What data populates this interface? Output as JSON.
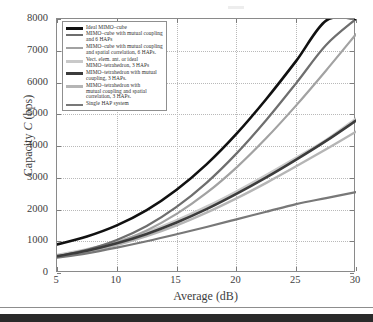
{
  "chart_data": {
    "type": "line",
    "title": "",
    "xlabel": "Average (dB)",
    "ylabel": "Capacity C (bps)",
    "xlim": [
      5,
      30
    ],
    "ylim": [
      0,
      8000
    ],
    "xticks": [
      5,
      10,
      15,
      20,
      25,
      30
    ],
    "yticks": [
      0,
      1000,
      2000,
      3000,
      4000,
      5000,
      6000,
      7000,
      8000
    ],
    "grid": true,
    "legend_position": "upper-left-inside",
    "x": [
      5,
      7.5,
      10,
      12.5,
      15,
      17.5,
      20,
      22.5,
      25,
      27.5,
      30
    ],
    "series": [
      {
        "name": "Ideal MIMO–cube",
        "color": "#111111",
        "width": 2.6,
        "values": [
          900,
          1150,
          1500,
          1980,
          2620,
          3420,
          4380,
          5480,
          6680,
          7950,
          8000
        ]
      },
      {
        "name": "MIMO–cube with mutual coupling and 6 HAPs",
        "color": "#6e6e6e",
        "width": 2.2,
        "values": [
          520,
          730,
          1040,
          1480,
          2080,
          2840,
          3760,
          4820,
          5980,
          7180,
          8000
        ]
      },
      {
        "name": "MIMO–cube with mutual coupling and spatial correlation, 6 HAPs.",
        "color": "#a2a2a2",
        "width": 2.2,
        "values": [
          520,
          690,
          960,
          1340,
          1860,
          2520,
          3320,
          4250,
          5280,
          6380,
          7520
        ]
      },
      {
        "name": "Vect. elem. ant. or ideal MIMO–tetrahedron, 3 HAPs",
        "color": "#c9c9c9",
        "width": 3.0,
        "values": [
          560,
          740,
          980,
          1280,
          1650,
          2080,
          2560,
          3080,
          3620,
          4180,
          4850
        ]
      },
      {
        "name": "MIMO–tetrahedron with mutual coupling, 3 HAPs.",
        "color": "#3c3c3c",
        "width": 2.6,
        "values": [
          530,
          700,
          935,
          1230,
          1590,
          2010,
          2490,
          3010,
          3570,
          4160,
          4800
        ]
      },
      {
        "name": "MIMO–tetrahedron with mutual coupling and spatial correlation, 3 HAPs.",
        "color": "#b5b5b5",
        "width": 2.4,
        "values": [
          500,
          660,
          880,
          1160,
          1500,
          1900,
          2350,
          2840,
          3360,
          3900,
          4450
        ]
      },
      {
        "name": "Single HAP system",
        "color": "#787878",
        "width": 2.2,
        "values": [
          480,
          620,
          800,
          1000,
          1220,
          1450,
          1690,
          1930,
          2170,
          2360,
          2550
        ]
      }
    ]
  },
  "axes": {
    "x_title": "Average (dB)",
    "y_title_prefix": "Capacity ",
    "y_title_italic": "C",
    "y_title_suffix": " (bps)",
    "x_tick_labels": [
      "5",
      "10",
      "15",
      "20",
      "25",
      "30"
    ],
    "y_tick_labels": [
      "0",
      "1000",
      "2000",
      "3000",
      "4000",
      "5000",
      "6000",
      "7000",
      "8000"
    ]
  },
  "legend": {
    "entries": [
      {
        "label": "Ideal MIMO–cube",
        "swatch_color": "#111111",
        "swatch_height": 2.6
      },
      {
        "label": "MIMO–cube with mutual coupling\nand 6 HAPs",
        "swatch_color": "#6e6e6e",
        "swatch_height": 2.2
      },
      {
        "label": "MIMO–cube with mutual coupling\nand spatial correlation, 6 HAPs.",
        "swatch_color": "#a2a2a2",
        "swatch_height": 2.2
      },
      {
        "label": "Vect. elem. ant. or ideal\nMIMO–tetrahedron, 3 HAPs",
        "swatch_color": "#c9c9c9",
        "swatch_height": 3.0
      },
      {
        "label": "MIMO–tetrahedron with mutual\ncoupling, 3 HAPs.",
        "swatch_color": "#3c3c3c",
        "swatch_height": 2.6
      },
      {
        "label": "MIMO–tetrahedron with\nmutual coupling and spatial\ncorrelation, 3 HAPs.",
        "swatch_color": "#b5b5b5",
        "swatch_height": 2.4
      },
      {
        "label": "Single HAP system",
        "swatch_color": "#787878",
        "swatch_height": 2.2
      }
    ]
  }
}
